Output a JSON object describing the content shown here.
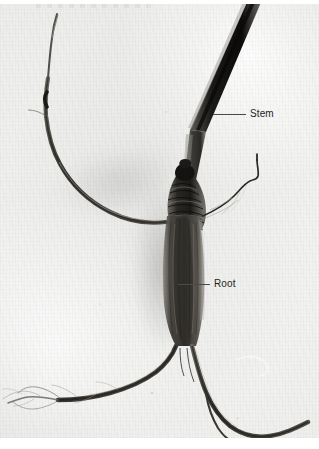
{
  "figure": {
    "type": "photograph",
    "medium": "black-and-white photograph on light gray backing sheet",
    "alt": "Black and white photograph of an uprooted plant specimen. A dark slender stem runs diagonally from the upper right down to a swollen ribbed crown in the centre, below which a thick tapering taproot descends and forks into two lateral roots. A long thin lateral root extends to the upper left and fine root hairs trail off to the lower left.",
    "background_color": "#ececeb",
    "plate_edge_color": "#ffffff"
  },
  "callouts": [
    {
      "id": "stem",
      "label": "Stem",
      "leader_color": "#4c4a46",
      "text_color": "#231f1c",
      "points_to": "dark diagonal stem in upper right"
    },
    {
      "id": "root",
      "label": "Root",
      "leader_color": "#4c4a46",
      "text_color": "#231f1c",
      "points_to": "thick tapering taproot in centre"
    }
  ],
  "specimen_parts": {
    "stem_label": "Stem",
    "root_label": "Root",
    "crown": "swollen ribbed crown",
    "taproot": "tapering taproot",
    "lateral_root_upper_left": "long thin lateral root",
    "lateral_root_right": "fine wavy lateral root",
    "root_fork": "forked lower roots",
    "root_hairs": "fine root hairs"
  }
}
